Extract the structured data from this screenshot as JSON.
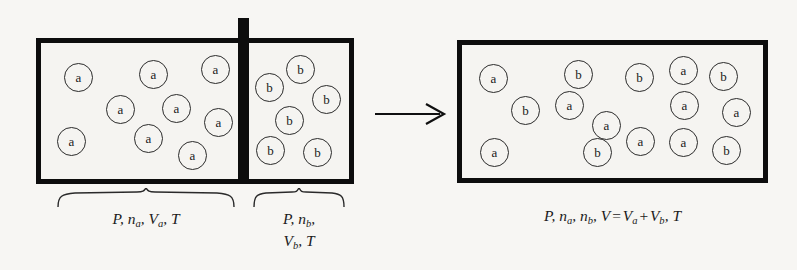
{
  "figure": {
    "background_color": "#f7f6f3",
    "ink_color": "#0d0d0d",
    "chamber_fill": "#f5f4f1"
  },
  "left_assembly": {
    "chamber_a": {
      "name": "chamber-a",
      "species_label": "a",
      "molecule_count": 9,
      "molecules": [
        {
          "label": "a",
          "x": 64,
          "y": 63
        },
        {
          "label": "a",
          "x": 139,
          "y": 60
        },
        {
          "label": "a",
          "x": 201,
          "y": 55
        },
        {
          "label": "a",
          "x": 106,
          "y": 95
        },
        {
          "label": "a",
          "x": 162,
          "y": 94
        },
        {
          "label": "a",
          "x": 204,
          "y": 108
        },
        {
          "label": "a",
          "x": 57,
          "y": 127
        },
        {
          "label": "a",
          "x": 134,
          "y": 124
        },
        {
          "label": "a",
          "x": 178,
          "y": 141
        }
      ],
      "caption_lines": [
        "P, n_a, V_a, T"
      ]
    },
    "chamber_b": {
      "name": "chamber-b",
      "species_label": "b",
      "molecule_count": 6,
      "molecules": [
        {
          "label": "b",
          "x": 286,
          "y": 55
        },
        {
          "label": "b",
          "x": 255,
          "y": 73
        },
        {
          "label": "b",
          "x": 312,
          "y": 85
        },
        {
          "label": "b",
          "x": 275,
          "y": 106
        },
        {
          "label": "b",
          "x": 256,
          "y": 136
        },
        {
          "label": "b",
          "x": 303,
          "y": 138
        }
      ],
      "caption_lines": [
        "P, n_b,",
        "V_b, T"
      ]
    }
  },
  "right_assembly": {
    "chamber_mixed": {
      "name": "chamber-mixed",
      "molecule_count": 15,
      "molecules": [
        {
          "label": "a",
          "x": 479,
          "y": 64
        },
        {
          "label": "b",
          "x": 564,
          "y": 60
        },
        {
          "label": "b",
          "x": 625,
          "y": 63
        },
        {
          "label": "a",
          "x": 669,
          "y": 56
        },
        {
          "label": "b",
          "x": 709,
          "y": 62
        },
        {
          "label": "b",
          "x": 511,
          "y": 96
        },
        {
          "label": "a",
          "x": 555,
          "y": 91
        },
        {
          "label": "a",
          "x": 670,
          "y": 91
        },
        {
          "label": "a",
          "x": 722,
          "y": 98
        },
        {
          "label": "a",
          "x": 592,
          "y": 111
        },
        {
          "label": "a",
          "x": 480,
          "y": 138
        },
        {
          "label": "b",
          "x": 583,
          "y": 138
        },
        {
          "label": "a",
          "x": 626,
          "y": 127
        },
        {
          "label": "a",
          "x": 669,
          "y": 128
        },
        {
          "label": "b",
          "x": 712,
          "y": 136
        }
      ],
      "caption_lines": [
        "P, n_a, n_b, V = V_a + V_b, T"
      ]
    }
  },
  "captions": {
    "left": {
      "P": "P",
      "comma": ",",
      "n": "n",
      "n_sub": "a",
      "V": "V",
      "V_sub": "a",
      "T": "T"
    },
    "middle": {
      "P": "P",
      "n": "n",
      "n_sub": "b",
      "V": "V",
      "V_sub": "b",
      "T": "T"
    },
    "right": {
      "P": "P",
      "n1": "n",
      "n1_sub": "a",
      "n2": "n",
      "n2_sub": "b",
      "V": "V",
      "equals": "=",
      "Va": "V",
      "Va_sub": "a",
      "plus": "+",
      "Vb": "V",
      "Vb_sub": "b",
      "T": "T"
    }
  },
  "arrow": {
    "name": "process-arrow",
    "direction": "right",
    "label": ""
  }
}
